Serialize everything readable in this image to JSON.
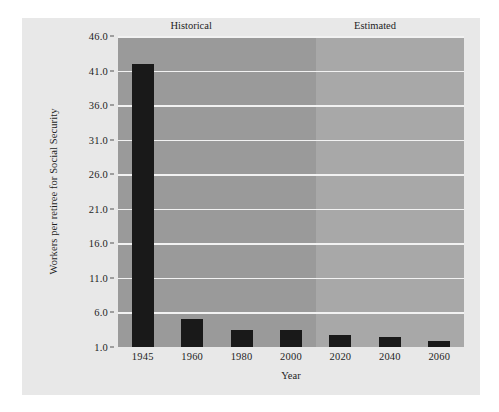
{
  "figure": {
    "background_color": "#e8e8e8",
    "plot_background_color": "#9a9a9a",
    "estimated_background_color": "#a8a8a8",
    "gridline_color": "#f2f2f2",
    "bar_color": "#191919"
  },
  "annotations": {
    "historical_label": "Historical",
    "estimated_label": "Estimated"
  },
  "chart_data": {
    "type": "bar",
    "title": "",
    "xlabel": "Year",
    "ylabel": "Workers per retiree for Social Security",
    "categories": [
      "1945",
      "1960",
      "1980",
      "2000",
      "2020",
      "2040",
      "2060"
    ],
    "values": [
      41.9,
      5.1,
      3.4,
      3.4,
      2.8,
      2.4,
      1.9
    ],
    "ylim": [
      1.0,
      46.0
    ],
    "ytick_labels": [
      "1.0",
      "6.0",
      "11.0",
      "16.0",
      "21.0",
      "26.0",
      "31.0",
      "36.0",
      "41.0",
      "46.0"
    ],
    "yticks": [
      1.0,
      6.0,
      11.0,
      16.0,
      21.0,
      26.0,
      31.0,
      36.0,
      41.0,
      46.0
    ],
    "grid": true,
    "legend": "none",
    "regions": [
      {
        "name": "Historical",
        "categories": [
          "1945",
          "1960",
          "1980",
          "2000"
        ]
      },
      {
        "name": "Estimated",
        "categories": [
          "2020",
          "2040",
          "2060"
        ]
      }
    ]
  }
}
